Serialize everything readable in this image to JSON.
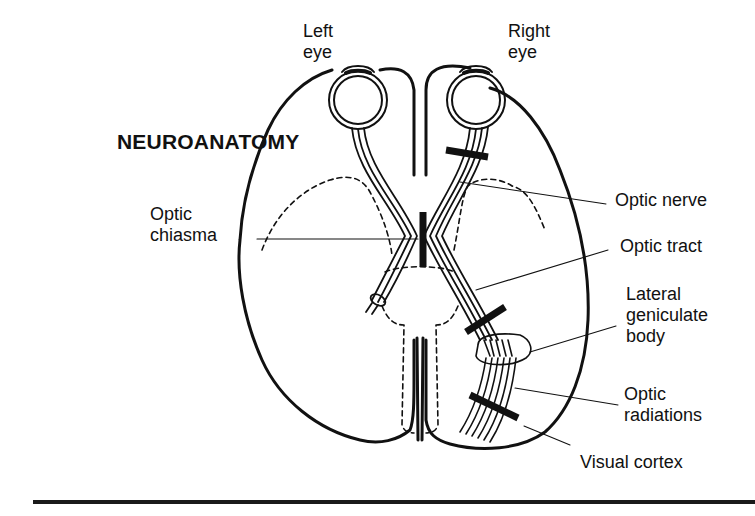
{
  "title": "NEUROANATOMY",
  "colors": {
    "ink": "#111111",
    "background": "#ffffff"
  },
  "labels": {
    "left_eye": [
      "Left",
      "eye"
    ],
    "right_eye": [
      "Right",
      "eye"
    ],
    "optic_chiasma": [
      "Optic",
      "chiasma"
    ],
    "optic_nerve": "Optic nerve",
    "optic_tract": "Optic tract",
    "lateral_geniculate_body": [
      "Lateral",
      "geniculate",
      "body"
    ],
    "optic_radiations": [
      "Optic",
      "radiations"
    ],
    "visual_cortex": "Visual cortex"
  },
  "lesion_markers": [
    {
      "name": "optic-nerve-lesion"
    },
    {
      "name": "optic-chiasma-lesion"
    },
    {
      "name": "optic-tract-lesion"
    },
    {
      "name": "optic-radiations-lesion"
    }
  ]
}
